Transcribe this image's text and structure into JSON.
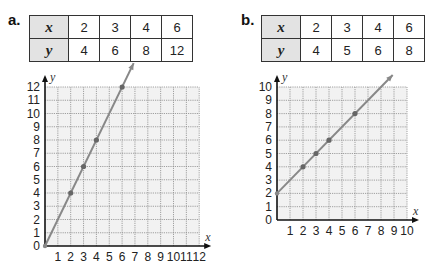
{
  "parts": [
    {
      "label": "a.",
      "table": {
        "x_header": "x",
        "y_header": "y",
        "x": [
          "2",
          "3",
          "4",
          "6"
        ],
        "y": [
          "4",
          "6",
          "8",
          "12"
        ]
      },
      "axes": {
        "xlabel": "x",
        "ylabel": "y"
      }
    },
    {
      "label": "b.",
      "table": {
        "x_header": "x",
        "y_header": "y",
        "x": [
          "2",
          "3",
          "4",
          "6"
        ],
        "y": [
          "4",
          "5",
          "6",
          "8"
        ]
      },
      "axes": {
        "xlabel": "x",
        "ylabel": "y"
      }
    }
  ],
  "chart_data": [
    {
      "type": "line",
      "title": "a.",
      "xlabel": "x",
      "ylabel": "y",
      "xlim": [
        0,
        12
      ],
      "ylim": [
        0,
        12
      ],
      "x_ticks": [
        1,
        2,
        3,
        4,
        5,
        6,
        7,
        8,
        9,
        10,
        11,
        12
      ],
      "y_ticks": [
        0,
        1,
        2,
        3,
        4,
        5,
        6,
        7,
        8,
        9,
        10,
        11,
        12
      ],
      "grid": true,
      "points": {
        "x": [
          2,
          3,
          4,
          6
        ],
        "y": [
          4,
          6,
          8,
          12
        ]
      },
      "line": {
        "slope": 2,
        "intercept": 0,
        "equation": "y = 2x"
      },
      "color": "#888888"
    },
    {
      "type": "line",
      "title": "b.",
      "xlabel": "x",
      "ylabel": "y",
      "xlim": [
        0,
        10
      ],
      "ylim": [
        0,
        10
      ],
      "x_ticks": [
        1,
        2,
        3,
        4,
        5,
        6,
        7,
        8,
        9,
        10
      ],
      "y_ticks": [
        0,
        1,
        2,
        3,
        4,
        5,
        6,
        7,
        8,
        9,
        10
      ],
      "grid": true,
      "points": {
        "x": [
          2,
          3,
          4,
          6
        ],
        "y": [
          4,
          5,
          6,
          8
        ]
      },
      "line": {
        "slope": 1,
        "intercept": 2,
        "equation": "y = x + 2"
      },
      "color": "#888888"
    }
  ]
}
